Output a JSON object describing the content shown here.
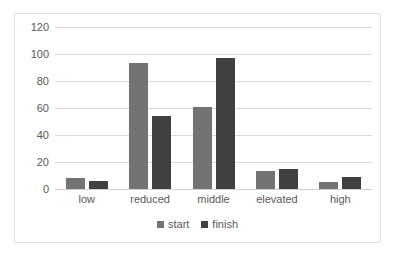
{
  "chart_data": {
    "type": "bar",
    "title": "",
    "subtitle": "",
    "xlabel": "",
    "ylabel": "",
    "categories": [
      "low",
      "reduced",
      "middle",
      "elevated",
      "high"
    ],
    "series": [
      {
        "name": "start",
        "color": "#737373",
        "values": [
          8,
          93,
          61,
          13,
          5
        ]
      },
      {
        "name": "finish",
        "color": "#404040",
        "values": [
          6,
          54,
          97,
          15,
          9
        ]
      }
    ],
    "ylim": [
      0,
      120
    ],
    "yticks": [
      0,
      20,
      40,
      60,
      80,
      100,
      120
    ],
    "ytick_labels": [
      "0",
      "20",
      "40",
      "60",
      "80",
      "100",
      "120"
    ],
    "grid": true,
    "grid_axis": "y",
    "legend_position": "bottom",
    "plot_background": "#ffffff",
    "grid_color": "#d9d9d9",
    "border_color": "#e2e2e2",
    "text_color": "#595959"
  }
}
